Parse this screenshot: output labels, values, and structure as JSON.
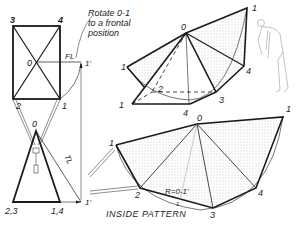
{
  "note": {
    "line1": "Rotate 0-1",
    "line2": "to a frontal",
    "line3": "position"
  },
  "top_view": {
    "corners": {
      "tl": "3",
      "tr": "4",
      "bl": "2",
      "br": "1"
    },
    "center": "0",
    "fl_label": "FL",
    "rotated_point": "1'"
  },
  "front_view": {
    "apex": "0",
    "base_left": "2,3",
    "base_right": "1,4",
    "tl_label": "TL",
    "rotated_point": "1'"
  },
  "pictorial": {
    "apex": "0",
    "points": [
      "1",
      "1",
      "2",
      "3",
      "4",
      "1",
      "4"
    ]
  },
  "pattern": {
    "apex": "0",
    "points": [
      "1",
      "2",
      "3",
      "4"
    ],
    "top_label": "4",
    "radius_label": "R=0-1'",
    "arc_tick": "1",
    "title": "INSIDE PATTERN",
    "title_num": "3"
  },
  "colors": {
    "line": "#1a1a1a",
    "fill_dots": "#9a9a9a"
  }
}
